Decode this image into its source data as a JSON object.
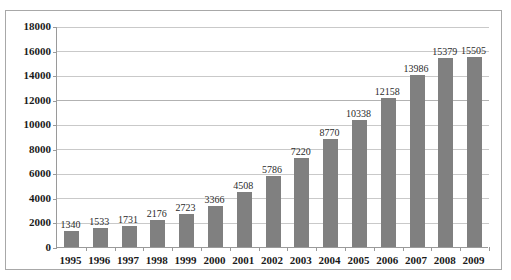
{
  "chart_data": {
    "type": "bar",
    "title": "",
    "subtitle": "",
    "xlabel": "",
    "ylabel": "",
    "categories": [
      "1995",
      "1996",
      "1997",
      "1998",
      "1999",
      "2000",
      "2001",
      "2002",
      "2003",
      "2004",
      "2005",
      "2006",
      "2007",
      "2008",
      "2009"
    ],
    "values": [
      1340,
      1533,
      1731,
      2176,
      2723,
      3366,
      4508,
      5786,
      7220,
      8770,
      10338,
      12158,
      13986,
      15379,
      15505
    ],
    "data_labels": [
      "1340",
      "1533",
      "1731",
      "2176",
      "2723",
      "3366",
      "4508",
      "5786",
      "7220",
      "8770",
      "10338",
      "12158",
      "13986",
      "15379",
      "15505"
    ],
    "ylim": [
      0,
      18000
    ],
    "y_ticks": [
      0,
      2000,
      4000,
      6000,
      8000,
      10000,
      12000,
      14000,
      16000,
      18000
    ],
    "y_tick_labels": [
      "0",
      "2000",
      "4000",
      "6000",
      "8000",
      "10000",
      "12000",
      "14000",
      "16000",
      "18000"
    ],
    "grid": true,
    "legend": false,
    "legend_position": "none",
    "series": [
      {
        "name": "",
        "color": "#808080",
        "values": [
          1340,
          1533,
          1731,
          2176,
          2723,
          3366,
          4508,
          5786,
          7220,
          8770,
          10338,
          12158,
          13986,
          15379,
          15505
        ]
      }
    ],
    "colors": {
      "bar": "#808080",
      "grid": "#c9c9c9",
      "axis": "#9a9a9a",
      "frame": "#a8a8a8",
      "label_text": "#1a1a1a",
      "value_text": "#2b2b2b",
      "background": "#ffffff"
    }
  }
}
